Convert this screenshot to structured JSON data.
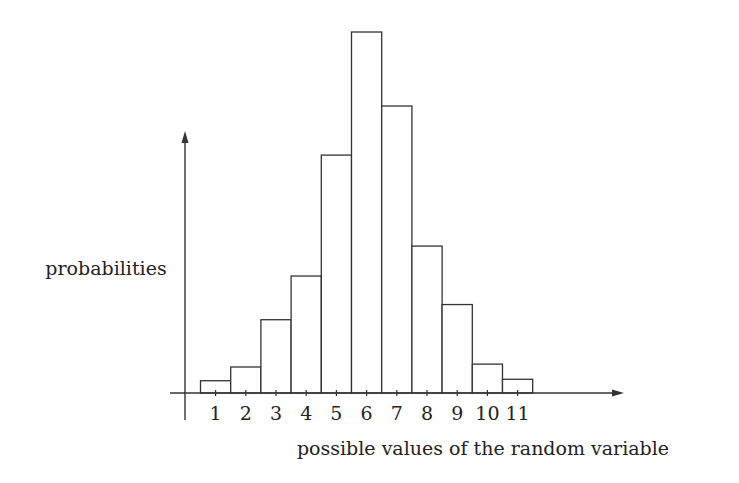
{
  "chart_data": {
    "type": "bar",
    "title": "",
    "xlabel": "possible values of the random variable",
    "ylabel": "probabilities",
    "categories": [
      "1",
      "2",
      "3",
      "4",
      "5",
      "6",
      "7",
      "8",
      "9",
      "10",
      "11"
    ],
    "values": [
      0.034,
      0.072,
      0.203,
      0.324,
      0.659,
      1.0,
      0.795,
      0.407,
      0.245,
      0.08,
      0.038
    ],
    "value_units": "relative height (tallest bar = 1.0); no y tick values shown",
    "grid": false,
    "legend": null,
    "bar_style": {
      "fill": "#ffffff",
      "stroke": "#333333"
    }
  },
  "axes": {
    "x_label": "possible values of the random variable",
    "y_label": "probabilities",
    "tick_labels": [
      "1",
      "2",
      "3",
      "4",
      "5",
      "6",
      "7",
      "8",
      "9",
      "10",
      "11"
    ]
  }
}
